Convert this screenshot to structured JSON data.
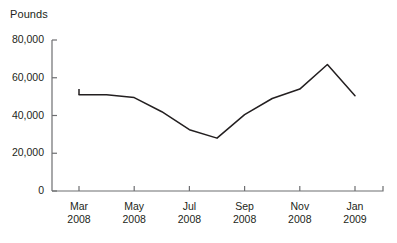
{
  "chart_data": {
    "type": "line",
    "title": "",
    "subtitle": "",
    "xlabel": "",
    "ylabel": "Pounds",
    "ylim": [
      0,
      80000
    ],
    "yticks": [
      0,
      20000,
      40000,
      60000,
      80000
    ],
    "ytick_labels": [
      "0",
      "20,000",
      "40,000",
      "60,000",
      "80,000"
    ],
    "xtick_labels": [
      {
        "month": "Mar",
        "year": "2008"
      },
      {
        "month": "May",
        "year": "2008"
      },
      {
        "month": "Jul",
        "year": "2008"
      },
      {
        "month": "Sep",
        "year": "2008"
      },
      {
        "month": "Nov",
        "year": "2008"
      },
      {
        "month": "Jan",
        "year": "2009"
      }
    ],
    "categories": [
      "Mar 2008",
      "Apr 2008",
      "May 2008",
      "Jun 2008",
      "Jul 2008",
      "Aug 2008",
      "Sep 2008",
      "Oct 2008",
      "Nov 2008",
      "Dec 2008",
      "Jan 2009"
    ],
    "values": [
      51000,
      51000,
      49500,
      42000,
      32500,
      28000,
      40500,
      49000,
      54000,
      67000,
      50500
    ],
    "series": [
      {
        "name": "Pounds",
        "values": [
          51000,
          51000,
          49500,
          42000,
          32500,
          28000,
          40500,
          49000,
          54000,
          67000,
          50500
        ],
        "color": "#231f20"
      }
    ],
    "grid": false,
    "legend": false,
    "legend_position": "none",
    "annotations": []
  },
  "axes": {
    "unit_label": "Pounds",
    "axis_color": "#6d6e71",
    "text_color": "#231f20"
  },
  "plot_geometry": {
    "left": 52,
    "right": 383,
    "top": 40,
    "bottom": 191,
    "x_start": 79,
    "x_step": 27.6,
    "y_zero": 191,
    "y_per_unit": 0.00189,
    "riser_top": 89
  }
}
